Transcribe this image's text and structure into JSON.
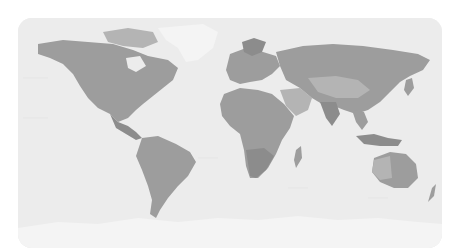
{
  "map": {
    "type": "world-choropleth",
    "projection": "equirectangular",
    "colors": {
      "ocean": "#ececec",
      "land_mid": "#9d9d9d",
      "land_light": "#b4b4b4",
      "land_dark": "#8c8c8c",
      "ice": "#f4f4f4",
      "page_background": "#ffffff"
    },
    "regions": [
      {
        "name": "north-america"
      },
      {
        "name": "greenland"
      },
      {
        "name": "south-america"
      },
      {
        "name": "europe"
      },
      {
        "name": "africa"
      },
      {
        "name": "asia"
      },
      {
        "name": "australia"
      },
      {
        "name": "antarctica"
      }
    ]
  }
}
